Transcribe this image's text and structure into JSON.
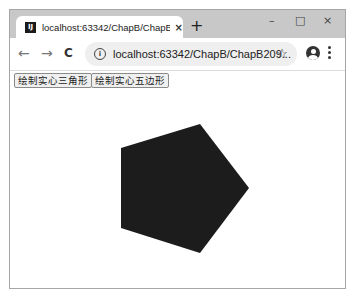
{
  "browser": {
    "tab": {
      "title": "localhost:63342/ChapB/ChapB",
      "favicon": "intellij-icon",
      "close_glyph": "×"
    },
    "new_tab_glyph": "+",
    "window_controls": {
      "minimize": "–",
      "maximize": "□",
      "close": "×"
    },
    "nav": {
      "back": "←",
      "forward": "→",
      "reload": "C"
    },
    "address_bar": {
      "url": "localhost:63342/ChapB/ChapB209...",
      "info_glyph": "i",
      "star_glyph": "☆"
    }
  },
  "page": {
    "buttons": [
      {
        "label": "绘制实心三角形"
      },
      {
        "label": "绘制实心五边形"
      }
    ],
    "shape": {
      "type": "filled-pentagon",
      "fill": "#1c1c1c",
      "vertices": [
        [
          121,
          148
        ],
        [
          200,
          124
        ],
        [
          249,
          188
        ],
        [
          200,
          253
        ],
        [
          121,
          228
        ]
      ]
    }
  }
}
